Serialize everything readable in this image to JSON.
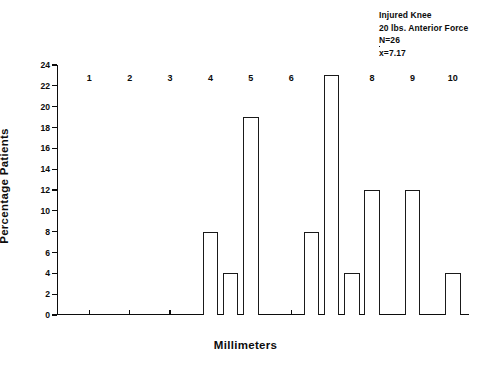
{
  "chart_data": {
    "type": "bar",
    "title": "",
    "xlabel": "Millimeters",
    "ylabel": "Percentage Patients",
    "xlim": [
      0.2,
      10.4
    ],
    "ylim": [
      0,
      24
    ],
    "ytick_step": 2,
    "grid": false,
    "legend": null,
    "bar_style": "open-outline",
    "xticks": [
      1,
      2,
      3,
      4,
      5,
      6,
      7,
      8,
      9,
      10
    ],
    "ytick_labels": [
      "0",
      "2",
      "4",
      "6",
      "8",
      "10",
      "12",
      "14",
      "16",
      "18",
      "20",
      "22",
      "24"
    ],
    "x": [
      4.0,
      4.5,
      5.0,
      6.5,
      7.0,
      7.5,
      8.0,
      9.0,
      10.0
    ],
    "values": [
      8,
      4,
      19,
      8,
      23,
      4,
      12,
      12,
      4
    ],
    "bar_width": 0.38,
    "annotations": [
      "Injured Knee",
      "20 lbs. Anterior Force",
      "N=26",
      "7.17"
    ],
    "mean_label_prefix": "x",
    "mean_label_equals": "=",
    "mean_value": "7.17",
    "n_label": "N=26",
    "colors": {
      "ink": "#0c0c0c",
      "bar_outline": "#1a1a1a",
      "bar_fill": "#ffffff",
      "background": "#ffffff"
    }
  }
}
